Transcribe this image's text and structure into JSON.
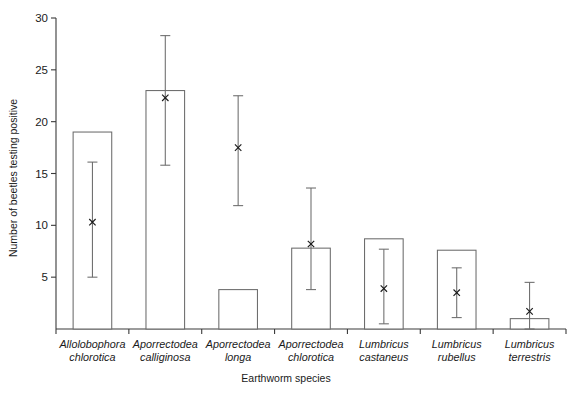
{
  "chart_data": {
    "type": "bar",
    "title": "",
    "xlabel": "Earthworm species",
    "ylabel": "Number of beetles testing positive",
    "ylim": [
      0,
      30
    ],
    "yticks": [
      0,
      5,
      10,
      15,
      20,
      25,
      30
    ],
    "ytick_labels": [
      "",
      "5",
      "10",
      "15",
      "20",
      "25",
      "30"
    ],
    "grid": false,
    "legend": "none",
    "categories": [
      "Allolobophora chlorotica",
      "Aporrectodea calliginosa",
      "Aporrectodea longa",
      "Aporrectodea chlorotica",
      "Lumbricus castaneus",
      "Lumbricus rubellus",
      "Lumbricus terrestris"
    ],
    "category_lines": [
      [
        "Allolobophora",
        "chlorotica"
      ],
      [
        "Aporrectodea",
        "calliginosa"
      ],
      [
        "Aporrectodea",
        "longa"
      ],
      [
        "Aporrectodea",
        "chlorotica"
      ],
      [
        "Lumbricus",
        "castaneus"
      ],
      [
        "Lumbricus",
        "rubellus"
      ],
      [
        "Lumbricus",
        "terrestris"
      ]
    ],
    "values": [
      19.0,
      23.0,
      3.8,
      7.8,
      8.7,
      7.6,
      1.0
    ],
    "series": [
      {
        "name": "Number of beetles testing positive",
        "values": [
          19.0,
          23.0,
          3.8,
          7.8,
          8.7,
          7.6,
          1.0
        ]
      },
      {
        "name": "Mean (x marker)",
        "values": [
          10.3,
          22.3,
          17.5,
          8.2,
          3.9,
          3.5,
          1.7
        ]
      }
    ],
    "error_bars": {
      "lower": [
        5.0,
        15.8,
        11.9,
        3.8,
        0.5,
        1.1,
        0.0
      ],
      "upper": [
        16.1,
        28.3,
        22.5,
        13.6,
        7.7,
        5.9,
        4.5
      ]
    },
    "marker": "x",
    "bar_fill": "#ffffff",
    "bar_stroke": "#6b6b6b",
    "axis_color": "#3a3a3a"
  }
}
